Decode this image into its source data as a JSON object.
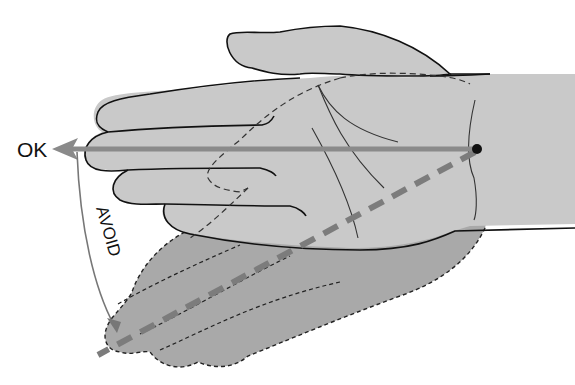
{
  "diagram": {
    "labels": {
      "ok": "OK",
      "avoid": "AVOID"
    },
    "elements": [
      {
        "name": "neutral-hand",
        "description": "Hand aligned straight with forearm",
        "fill": "#c9c9c9"
      },
      {
        "name": "deviated-hand",
        "description": "Hand bent toward little-finger side (ghosted, dashed outline)",
        "fill": "#a9a9a9"
      },
      {
        "name": "ok-axis-arrow",
        "description": "Straight solid arrow along hand axis pointing left",
        "color": "#8a8a8a"
      },
      {
        "name": "avoid-axis-line",
        "description": "Dashed line along deviated hand axis",
        "color": "#7c7c7c"
      },
      {
        "name": "pivot-point",
        "description": "Black dot at wrist pivot",
        "color": "#111111"
      },
      {
        "name": "avoid-arc-arrow",
        "description": "Curved arrow from OK axis down to deviated axis",
        "color": "#777777"
      }
    ],
    "colors": {
      "background": "#ffffff",
      "hand_fill": "#c9c9c9",
      "ghost_fill": "#a9a9a9",
      "outline": "#111111",
      "axis": "#8a8a8a"
    }
  }
}
